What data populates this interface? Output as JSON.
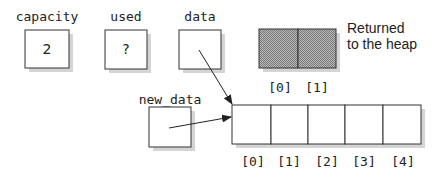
{
  "variables": [
    {
      "name": "capacity",
      "value": "2"
    },
    {
      "name": "used",
      "value": "?"
    },
    {
      "name": "data",
      "value": ""
    }
  ],
  "new_data": {
    "name": "new_data",
    "value": ""
  },
  "old_array": {
    "indices": [
      "[0]",
      "[1]"
    ],
    "note_line1": "Returned",
    "note_line2": "to the heap"
  },
  "new_array": {
    "indices": [
      "[0]",
      "[1]",
      "[2]",
      "[3]",
      "[4]"
    ]
  },
  "colors": {
    "heap_fill": "#9a9a9a",
    "shadow": "#d4d4d4",
    "stroke": "#333333"
  }
}
